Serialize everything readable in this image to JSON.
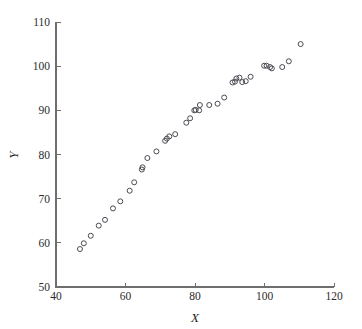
{
  "figure": {
    "width": 362,
    "height": 329,
    "background": "#ffffff"
  },
  "chart_data": {
    "type": "scatter",
    "title": "",
    "xlabel": "X",
    "ylabel": "Y",
    "xlim": [
      40,
      120
    ],
    "ylim": [
      50,
      110
    ],
    "xticks": [
      40,
      60,
      80,
      100,
      120
    ],
    "yticks": [
      50,
      60,
      70,
      80,
      90,
      100,
      110
    ],
    "grid": false,
    "legend": null,
    "marker": "open-circle",
    "marker_color": "#4a4a52",
    "axis_color": "#6e6e6e",
    "points": [
      {
        "x": 46.9,
        "y": 58.6
      },
      {
        "x": 48.0,
        "y": 59.9
      },
      {
        "x": 50.0,
        "y": 61.6
      },
      {
        "x": 52.3,
        "y": 63.9
      },
      {
        "x": 54.1,
        "y": 65.2
      },
      {
        "x": 56.4,
        "y": 67.8
      },
      {
        "x": 58.5,
        "y": 69.4
      },
      {
        "x": 61.2,
        "y": 71.8
      },
      {
        "x": 62.5,
        "y": 73.7
      },
      {
        "x": 64.7,
        "y": 76.6
      },
      {
        "x": 64.9,
        "y": 77.1
      },
      {
        "x": 66.3,
        "y": 79.2
      },
      {
        "x": 68.9,
        "y": 80.7
      },
      {
        "x": 71.4,
        "y": 83.1
      },
      {
        "x": 71.9,
        "y": 83.6
      },
      {
        "x": 72.6,
        "y": 84.1
      },
      {
        "x": 74.3,
        "y": 84.6
      },
      {
        "x": 77.5,
        "y": 87.2
      },
      {
        "x": 78.6,
        "y": 88.2
      },
      {
        "x": 79.8,
        "y": 90.0
      },
      {
        "x": 80.2,
        "y": 90.1
      },
      {
        "x": 81.2,
        "y": 90.0
      },
      {
        "x": 81.4,
        "y": 91.2
      },
      {
        "x": 84.1,
        "y": 91.2
      },
      {
        "x": 86.5,
        "y": 91.5
      },
      {
        "x": 88.4,
        "y": 92.9
      },
      {
        "x": 90.8,
        "y": 96.3
      },
      {
        "x": 91.5,
        "y": 96.5
      },
      {
        "x": 91.9,
        "y": 97.2
      },
      {
        "x": 92.8,
        "y": 97.4
      },
      {
        "x": 93.6,
        "y": 96.4
      },
      {
        "x": 94.6,
        "y": 96.6
      },
      {
        "x": 96.0,
        "y": 97.6
      },
      {
        "x": 99.9,
        "y": 100.1
      },
      {
        "x": 100.6,
        "y": 100.1
      },
      {
        "x": 101.6,
        "y": 99.8
      },
      {
        "x": 102.1,
        "y": 99.5
      },
      {
        "x": 105.1,
        "y": 99.8
      },
      {
        "x": 107.0,
        "y": 101.1
      },
      {
        "x": 110.4,
        "y": 105.0
      }
    ]
  }
}
